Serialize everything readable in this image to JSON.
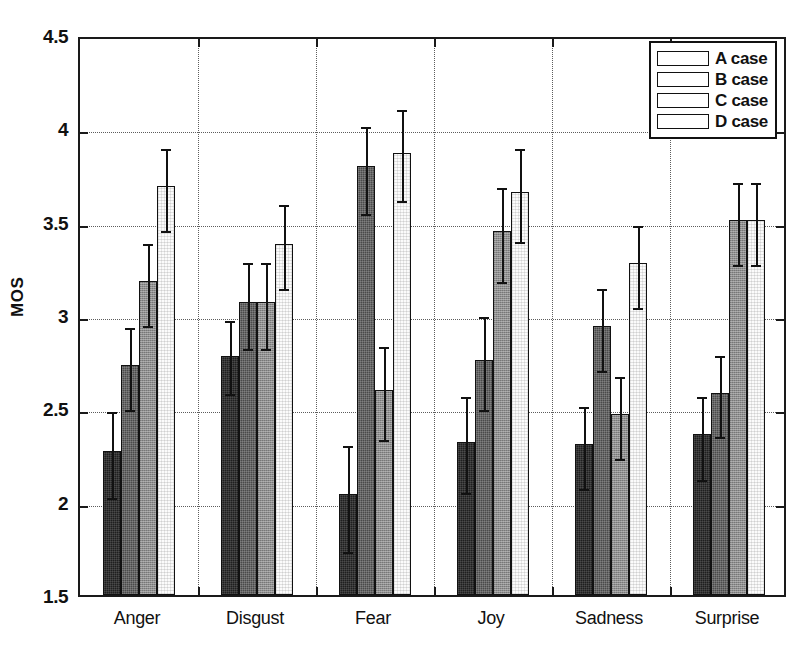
{
  "chart_data": {
    "type": "bar",
    "title": "",
    "xlabel": "",
    "ylabel": "MOS",
    "ylim": [
      1.5,
      4.5
    ],
    "yticks": [
      1.5,
      2,
      2.5,
      3,
      3.5,
      4,
      4.5
    ],
    "ytick_labels": [
      "1.5",
      "2",
      "2.5",
      "3",
      "3.5",
      "4",
      "4.5"
    ],
    "grid": "dotted-both-axes",
    "legend_position": "top-right",
    "categories": [
      "Anger",
      "Disgust",
      "Fear",
      "Joy",
      "Sadness",
      "Surprise"
    ],
    "series": [
      {
        "name": "A case",
        "color": "#1f1f1f",
        "values": [
          2.27,
          2.78,
          2.04,
          2.32,
          2.31,
          2.36
        ],
        "error_low": [
          2.04,
          2.6,
          1.75,
          2.07,
          2.09,
          2.14
        ],
        "error_high": [
          2.5,
          2.99,
          2.32,
          2.58,
          2.53,
          2.58
        ]
      },
      {
        "name": "B case",
        "color": "#4a4a4a",
        "values": [
          2.73,
          3.07,
          3.8,
          2.76,
          2.94,
          2.58
        ],
        "error_low": [
          2.51,
          2.84,
          3.56,
          2.51,
          2.72,
          2.37
        ],
        "error_high": [
          2.95,
          3.3,
          4.03,
          3.01,
          3.16,
          2.8
        ]
      },
      {
        "name": "C case",
        "color": "#8e8e8e",
        "values": [
          3.18,
          3.07,
          2.6,
          3.45,
          2.47,
          3.51
        ],
        "error_low": [
          2.96,
          2.84,
          2.35,
          3.2,
          2.25,
          3.29
        ],
        "error_high": [
          3.4,
          3.3,
          2.85,
          3.7,
          2.69,
          3.73
        ]
      },
      {
        "name": "D case",
        "color": "#fbfbfb",
        "values": [
          3.69,
          3.38,
          3.87,
          3.66,
          3.28,
          3.51
        ],
        "error_low": [
          3.47,
          3.16,
          3.63,
          3.41,
          3.06,
          3.29
        ],
        "error_high": [
          3.91,
          3.61,
          4.12,
          3.91,
          3.5,
          3.73
        ]
      }
    ]
  },
  "legend": {
    "items": [
      {
        "label": "A case"
      },
      {
        "label": "B case"
      },
      {
        "label": "C case"
      },
      {
        "label": "D case"
      }
    ]
  }
}
